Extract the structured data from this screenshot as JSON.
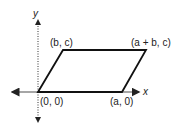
{
  "diagram": {
    "type": "parallelogram-on-axes",
    "axes": {
      "x_label": "x",
      "y_label": "y"
    },
    "vertices": [
      {
        "label": "(0, 0)"
      },
      {
        "label": "(a, 0)"
      },
      {
        "label": "(a + b, c)"
      },
      {
        "label": "(b, c)"
      }
    ],
    "colors": {
      "shape_stroke": "#111111",
      "axis_stroke": "#222222",
      "text": "#222222"
    }
  }
}
